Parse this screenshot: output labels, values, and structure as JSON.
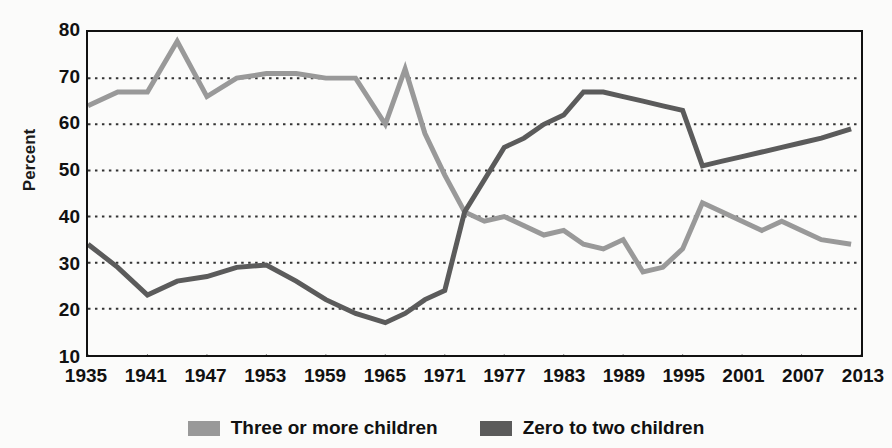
{
  "chart_data": {
    "type": "line",
    "title": "",
    "subtitle": "",
    "xlabel": "",
    "ylabel": "Percent",
    "xlim": [
      1935,
      2013
    ],
    "ylim": [
      10,
      80
    ],
    "ytick_step": 10,
    "xtick_step": 6,
    "grid": true,
    "grid_style": "dotted-horizontal",
    "legend_position": "bottom-center",
    "yticks": [
      10,
      20,
      30,
      40,
      50,
      60,
      70,
      80
    ],
    "xticks": [
      1935,
      1941,
      1947,
      1953,
      1959,
      1965,
      1971,
      1977,
      1983,
      1989,
      1995,
      2001,
      2007,
      2013
    ],
    "ytick_labels": [
      "10",
      "20",
      "30",
      "40",
      "50",
      "60",
      "70",
      "80"
    ],
    "xtick_labels": [
      "1935",
      "1941",
      "1947",
      "1953",
      "1959",
      "1965",
      "1971",
      "1977",
      "1983",
      "1989",
      "1995",
      "2001",
      "2007",
      "2013"
    ],
    "colors": {
      "three_or_more": "#999999",
      "zero_to_two": "#5b5b5b",
      "axis": "#111111",
      "grid": "#333333",
      "background": "#fbfbfa"
    },
    "series": [
      {
        "name": "Three or more children",
        "color": "#999999",
        "x": [
          1935,
          1938,
          1941,
          1944,
          1947,
          1950,
          1953,
          1956,
          1959,
          1962,
          1965,
          1967,
          1969,
          1971,
          1973,
          1975,
          1977,
          1979,
          1981,
          1983,
          1985,
          1987,
          1989,
          1991,
          1993,
          1995,
          1997,
          1999,
          2001,
          2003,
          2005,
          2007,
          2009,
          2012
        ],
        "values": [
          64,
          67,
          67,
          78,
          66,
          70,
          71,
          71,
          70,
          70,
          60,
          72,
          58,
          49,
          41,
          39,
          40,
          38,
          36,
          37,
          34,
          33,
          35,
          28,
          29,
          33,
          43,
          41,
          39,
          37,
          39,
          37,
          35,
          34
        ]
      },
      {
        "name": "Zero to two children",
        "color": "#5b5b5b",
        "x": [
          1935,
          1938,
          1941,
          1944,
          1947,
          1950,
          1953,
          1956,
          1959,
          1962,
          1965,
          1967,
          1969,
          1971,
          1973,
          1975,
          1977,
          1979,
          1981,
          1983,
          1985,
          1987,
          1989,
          1991,
          1993,
          1995,
          1997,
          1999,
          2001,
          2003,
          2005,
          2007,
          2009,
          2012
        ],
        "values": [
          34,
          29,
          23,
          26,
          27,
          29,
          29.5,
          26,
          22,
          19,
          17,
          19,
          22,
          24,
          41,
          48,
          55,
          57,
          60,
          62,
          67,
          67,
          66,
          65,
          64,
          63,
          51,
          52,
          53,
          54,
          55,
          56,
          57,
          59
        ]
      }
    ]
  },
  "axes": {
    "y_title": "Percent"
  },
  "legend": {
    "items": [
      {
        "label": "Three or more children",
        "color": "#999999"
      },
      {
        "label": "Zero to two children",
        "color": "#5b5b5b"
      }
    ]
  }
}
